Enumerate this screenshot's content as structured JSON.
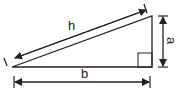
{
  "diagram": {
    "labels": {
      "hypotenuse": "h",
      "vertical_side": "a",
      "base": "b"
    },
    "colors": {
      "stroke": "#222222",
      "background": "#ffffff"
    },
    "elements": {
      "triangle": {
        "vertices": [
          [
            12,
            67
          ],
          [
            152,
            67
          ],
          [
            152,
            16
          ]
        ],
        "right_angle_at": [
          152,
          67
        ]
      },
      "hypotenuse_arrow": {
        "from": [
          15,
          58
        ],
        "to": [
          146,
          10
        ]
      },
      "vertical_arrow": {
        "x": 163,
        "from_y": 16,
        "to_y": 67
      },
      "base_arrow": {
        "y": 82,
        "from_x": 14,
        "to_x": 150
      }
    }
  }
}
